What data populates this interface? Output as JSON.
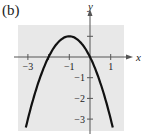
{
  "panel_label": "(b)",
  "colors": {
    "grid_bg": "#e8e8e8",
    "axis": "#555555",
    "curve": "#111111",
    "text": "#222222"
  },
  "chart_data": {
    "type": "line",
    "title": "",
    "xlabel": "x",
    "ylabel": "y",
    "xlim": [
      -3.5,
      1.5
    ],
    "ylim": [
      -3.5,
      1.5
    ],
    "x_ticks": [
      -3,
      -2,
      -1,
      0,
      1
    ],
    "x_tick_labels": [
      "-3",
      "-1",
      "1"
    ],
    "x_tick_label_values": [
      -3,
      -1,
      1
    ],
    "y_ticks": [
      1,
      -1,
      -2,
      -3
    ],
    "y_tick_labels": [
      "-1",
      "-2",
      "-3"
    ],
    "y_tick_label_values": [
      -1,
      -2,
      -3
    ],
    "grid": false,
    "series": [
      {
        "name": "y = -(x+1)^2 + 1",
        "x": [
          -3.0,
          -2.5,
          -2.0,
          -1.5,
          -1.0,
          -0.5,
          0.0,
          0.5,
          1.0
        ],
        "y": [
          -3.0,
          -1.25,
          0.0,
          0.75,
          1.0,
          0.75,
          0.0,
          -1.25,
          -3.0
        ]
      }
    ],
    "annotations": [
      "vertex (-1, 1)",
      "x-intercepts -2 and 0"
    ]
  }
}
